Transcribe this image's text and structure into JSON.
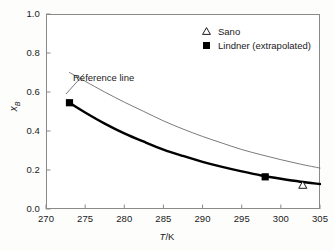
{
  "chart_data": {
    "type": "line",
    "title": "",
    "xlabel": "T/K",
    "xlabel_parts": {
      "italic": "T",
      "rest": "/K"
    },
    "ylabel": "xB",
    "ylabel_parts": {
      "italic": "x",
      "subscript": "B"
    },
    "xlim": [
      270,
      305
    ],
    "ylim": [
      0.0,
      1.0
    ],
    "xticks": [
      270,
      275,
      280,
      285,
      290,
      295,
      300,
      305
    ],
    "xticklabels": [
      "270",
      "275",
      "280",
      "285",
      "290",
      "295",
      "300",
      "305"
    ],
    "yticks": [
      0.0,
      0.2,
      0.4,
      0.6,
      0.8,
      1.0
    ],
    "yticklabels": [
      "0.0",
      "0.2",
      "0.4",
      "0.6",
      "0.8",
      "1.0"
    ],
    "grid": false,
    "legend_position": "top-right",
    "annotations": [
      {
        "text": "Reference line",
        "x": 279.0,
        "y": 0.7
      }
    ],
    "series": [
      {
        "name": "Reference line",
        "kind": "line",
        "style": "thin",
        "color": "#6b6b6b",
        "linewidth": 0.9,
        "x": [
          273.0,
          275.0,
          277.5,
          280.0,
          282.5,
          285.0,
          287.5,
          290.0,
          292.5,
          295.0,
          297.5,
          300.0,
          302.5,
          305.0
        ],
        "y": [
          0.7,
          0.655,
          0.6,
          0.548,
          0.5,
          0.452,
          0.41,
          0.372,
          0.338,
          0.305,
          0.278,
          0.253,
          0.23,
          0.21
        ]
      },
      {
        "name": "Lindner (extrapolated)",
        "kind": "line",
        "style": "thick",
        "color": "#000000",
        "linewidth": 2.4,
        "x": [
          273.0,
          275.0,
          277.5,
          280.0,
          282.5,
          285.0,
          287.5,
          290.0,
          292.5,
          295.0,
          297.5,
          300.0,
          302.5,
          305.0
        ],
        "y": [
          0.545,
          0.495,
          0.438,
          0.388,
          0.345,
          0.305,
          0.272,
          0.242,
          0.216,
          0.193,
          0.172,
          0.155,
          0.14,
          0.128
        ]
      },
      {
        "name": "Lindner (extrapolated)",
        "kind": "scatter",
        "marker": "filled-square",
        "color": "#000000",
        "points": [
          {
            "x": 273.0,
            "y": 0.545
          },
          {
            "x": 298.0,
            "y": 0.165
          }
        ]
      },
      {
        "name": "Sano",
        "kind": "scatter",
        "marker": "open-triangle",
        "color": "#000000",
        "points": [
          {
            "x": 302.8,
            "y": 0.122
          }
        ]
      }
    ]
  },
  "legend": {
    "entries": [
      {
        "label": "Sano",
        "marker": "open-triangle-icon"
      },
      {
        "label": "Lindner (extrapolated)",
        "marker": "filled-square-icon"
      }
    ]
  },
  "axes": {
    "x_title": "T/K",
    "y_title": "xB"
  },
  "colors": {
    "frame": "#8a8a8a",
    "reference_line": "#6b6b6b",
    "data_line": "#000000",
    "text": "#1a1a1a",
    "background": "#fdfdfc",
    "plot_background": "#ffffff"
  }
}
